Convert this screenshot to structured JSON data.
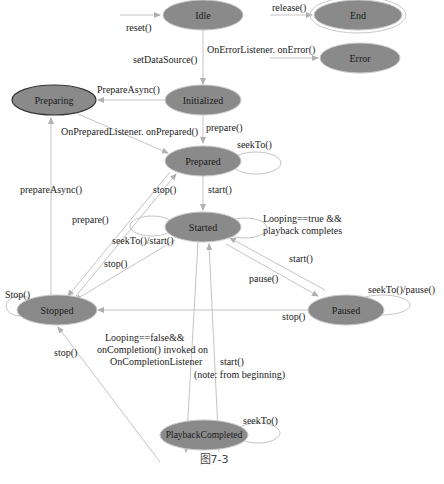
{
  "diagram": {
    "caption": "图7-3",
    "colors": {
      "node_fill": "#8a8a8a",
      "edge": "#c4c4c4",
      "text": "#1a1a1a"
    },
    "nodes": [
      {
        "id": "idle",
        "label": "Idle"
      },
      {
        "id": "end",
        "label": "End"
      },
      {
        "id": "error",
        "label": "Error"
      },
      {
        "id": "preparing",
        "label": "Preparing"
      },
      {
        "id": "initialized",
        "label": "Initialized"
      },
      {
        "id": "prepared",
        "label": "Prepared"
      },
      {
        "id": "started",
        "label": "Started"
      },
      {
        "id": "stopped",
        "label": "Stopped"
      },
      {
        "id": "paused",
        "label": "Paused"
      },
      {
        "id": "playbackcompleted",
        "label": "PlaybackCompleted"
      }
    ],
    "edges": [
      {
        "label": "reset()",
        "to": "idle"
      },
      {
        "label": "release()",
        "to": "end"
      },
      {
        "label": "setDataSource()",
        "from": "idle",
        "to": "initialized"
      },
      {
        "label": "OnErrorListener. onError()",
        "to": "error"
      },
      {
        "label": "PrepareAsync()",
        "from": "initialized",
        "to": "preparing"
      },
      {
        "label": "OnPreparedListener. onPrepared()",
        "from": "preparing",
        "to": "prepared"
      },
      {
        "label": "prepare()",
        "from": "initialized",
        "to": "prepared"
      },
      {
        "label": "seekTo()",
        "from": "prepared",
        "to": "prepared"
      },
      {
        "label": "prepareAsync()",
        "from": "stopped",
        "to": "preparing"
      },
      {
        "label": "stop()",
        "from": "prepared",
        "to": "stopped"
      },
      {
        "label": "start()",
        "from": "prepared",
        "to": "started"
      },
      {
        "label": "prepare()",
        "from": "stopped",
        "to": "prepared"
      },
      {
        "label": "Looping==true && playback completes",
        "line1": "Looping==true &&",
        "line2": "playback completes",
        "from": "started",
        "to": "started"
      },
      {
        "label": "seekTo()/start()",
        "from": "started",
        "to": "started"
      },
      {
        "label": "stop()",
        "from": "started",
        "to": "stopped"
      },
      {
        "label": "start()",
        "from": "paused",
        "to": "started"
      },
      {
        "label": "pause()",
        "from": "started",
        "to": "paused"
      },
      {
        "label": "Stop()",
        "from": "stopped",
        "to": "stopped"
      },
      {
        "label": "seekTo()/pause()",
        "from": "paused",
        "to": "paused"
      },
      {
        "label": "stop()",
        "from": "paused",
        "to": "stopped"
      },
      {
        "label": "Looping==false&& onCompletion() invoked on OnCompletionListener",
        "line1": "Looping==false&&",
        "line2": "onCompletion() invoked on",
        "line3": "OnCompletionListener",
        "from": "started",
        "to": "playbackcompleted"
      },
      {
        "label": "stop()",
        "from": "playbackcompleted",
        "to": "stopped"
      },
      {
        "label": "start() (note: from beginning)",
        "line1": "start()",
        "line2": "(note: from beginning)",
        "from": "playbackcompleted",
        "to": "started"
      },
      {
        "label": "seekTo()",
        "from": "playbackcompleted",
        "to": "playbackcompleted"
      }
    ]
  }
}
